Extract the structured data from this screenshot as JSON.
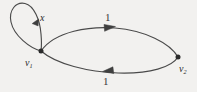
{
  "figure": {
    "type": "directed-graph",
    "background_color": "#f2f1ef",
    "stroke_color": "#4a4a4a",
    "label_color": "#2b2b2b"
  },
  "vertices": [
    {
      "id": "v1",
      "label": "v",
      "subscript": "1",
      "x": 41,
      "y": 51
    },
    {
      "id": "v2",
      "label": "v",
      "subscript": "2",
      "x": 178,
      "y": 57
    }
  ],
  "edges": [
    {
      "id": "self-loop",
      "from": "v1",
      "to": "v1",
      "label": "x",
      "label_x": 42,
      "label_y": 19,
      "arrow_direction": "left",
      "shape": "loop"
    },
    {
      "id": "top-arc",
      "from": "v1",
      "to": "v2",
      "label": "1",
      "label_x": 108,
      "label_y": 17,
      "arrow_direction": "right",
      "shape": "arc-upper"
    },
    {
      "id": "bottom-arc",
      "from": "v2",
      "to": "v1",
      "label": "1",
      "label_x": 106,
      "label_y": 81,
      "arrow_direction": "left",
      "shape": "arc-lower"
    }
  ],
  "labels": {
    "loop_weight": "x",
    "top_edge_weight": "1",
    "bottom_edge_weight": "1",
    "v1_base": "v",
    "v1_sub": "1",
    "v2_base": "v",
    "v2_sub": "2"
  }
}
